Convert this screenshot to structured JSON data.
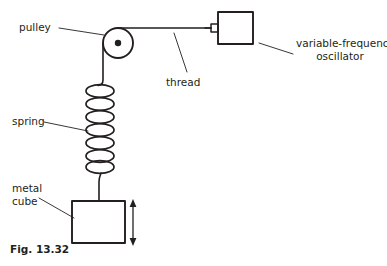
{
  "figure": {
    "caption": "Fig. 13.32",
    "stroke_color": "#231f20",
    "text_color": "#231f20",
    "background": "#ffffff"
  },
  "labels": {
    "pulley": "pulley",
    "thread": "thread",
    "oscillator_line1": "variable-frequency",
    "oscillator_line2": "oscillator",
    "spring": "spring",
    "metal_line1": "metal",
    "metal_line2": "cube"
  },
  "parts": {
    "pulley": {
      "name": "pulley-wheel",
      "cx": 118,
      "cy": 43,
      "r": 15,
      "hub_r": 3.2
    },
    "oscillator_box": {
      "name": "variable-frequency-oscillator",
      "x": 218,
      "y": 12,
      "w": 35,
      "h": 32
    },
    "oscillator_tab": {
      "name": "oscillator-terminal",
      "x": 211,
      "y": 24,
      "w": 7,
      "h": 8
    },
    "thread": {
      "name": "thread-line",
      "x1": 118,
      "y1": 28,
      "x2": 211,
      "y2": 28
    },
    "spring": {
      "name": "helical-spring",
      "coils": 7,
      "top": 85,
      "bottom": 172,
      "left": 86,
      "right": 114
    },
    "cube": {
      "name": "metal-cube",
      "x": 72,
      "y": 201,
      "w": 53,
      "h": 42
    },
    "arrow": {
      "name": "oscillation-arrow",
      "x": 133,
      "y_top": 200,
      "y_bottom": 245
    }
  }
}
